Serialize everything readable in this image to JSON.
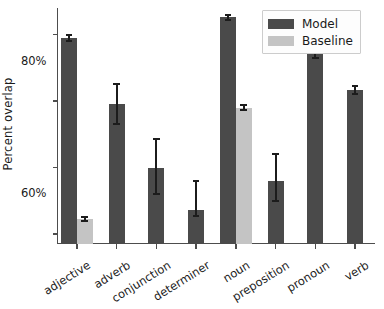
{
  "chart_data": {
    "type": "bar",
    "title": "",
    "xlabel": "",
    "ylabel": "Percent overlap",
    "categories": [
      "adjective",
      "adverb",
      "conjunction",
      "determiner",
      "noun",
      "preposition",
      "pronoun",
      "verb"
    ],
    "ylim": [
      17,
      88
    ],
    "ytick_values": [
      20,
      40,
      60,
      80
    ],
    "ytick_labels": [
      "20%",
      "40%",
      "60%",
      "80%"
    ],
    "grid": false,
    "legend_position": "upper right",
    "series": [
      {
        "name": "Model",
        "color": "#4a4a4a",
        "values": [
          79.0,
          59.0,
          40.0,
          27.2,
          85.2,
          36.0,
          75.5,
          63.4
        ],
        "err_low": [
          78.2,
          53.0,
          32.0,
          25.5,
          84.5,
          30.0,
          73.0,
          62.2
        ],
        "err_high": [
          79.8,
          65.0,
          48.5,
          36.0,
          86.0,
          44.0,
          78.5,
          64.6
        ]
      },
      {
        "name": "Baseline",
        "color": "#c4c4c4",
        "values": [
          24.5,
          null,
          null,
          null,
          58.0,
          null,
          null,
          null
        ],
        "err_low": [
          23.8,
          null,
          null,
          null,
          57.2,
          null,
          null,
          null
        ],
        "err_high": [
          25.2,
          null,
          null,
          null,
          58.9,
          null,
          null,
          null
        ]
      }
    ]
  },
  "legend": {
    "entries": [
      {
        "label": "Model"
      },
      {
        "label": "Baseline"
      }
    ]
  },
  "axes": {
    "ylabel": "Percent overlap"
  }
}
